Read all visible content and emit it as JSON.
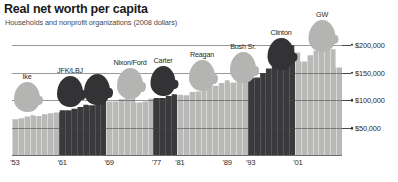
{
  "header": {
    "title": "Real net worth per capita",
    "subtitle": "Households and nonprofit organizations (2008 dollars)"
  },
  "caption": "",
  "chart_data": {
    "type": "bar",
    "title": "Real net worth per capita",
    "subtitle": "Households and nonprofit organizations (2008 dollars)",
    "xlabel": "",
    "ylabel": "",
    "ylim": [
      0,
      230000
    ],
    "grid": true,
    "legend_position": "none",
    "ytick_labels": [
      "$200,000",
      "$150,000",
      "$100,000",
      "$50,000"
    ],
    "ytick_values": [
      200000,
      150000,
      100000,
      50000
    ],
    "xtick_labels": [
      "'53",
      "'61",
      "'69",
      "'77",
      "'81",
      "'89",
      "'93",
      "'01"
    ],
    "xtick_years": [
      1953,
      1961,
      1969,
      1977,
      1981,
      1989,
      1993,
      2001
    ],
    "categories": [
      1953,
      1954,
      1955,
      1956,
      1957,
      1958,
      1959,
      1960,
      1961,
      1962,
      1963,
      1964,
      1965,
      1966,
      1967,
      1968,
      1969,
      1970,
      1971,
      1972,
      1973,
      1974,
      1975,
      1976,
      1977,
      1978,
      1979,
      1980,
      1981,
      1982,
      1983,
      1984,
      1985,
      1986,
      1987,
      1988,
      1989,
      1990,
      1991,
      1992,
      1993,
      1994,
      1995,
      1996,
      1997,
      1998,
      1999,
      2000,
      2001,
      2002,
      2003,
      2004,
      2005,
      2006,
      2007,
      2008
    ],
    "values": [
      67000,
      69000,
      72000,
      74000,
      73000,
      76000,
      78000,
      79000,
      83000,
      83000,
      86000,
      89000,
      93000,
      92000,
      97000,
      101000,
      99000,
      99000,
      103000,
      108000,
      105000,
      97000,
      99000,
      104000,
      105000,
      105000,
      109000,
      112000,
      111000,
      110000,
      116000,
      117000,
      122000,
      127000,
      127000,
      132000,
      137000,
      133000,
      137000,
      138000,
      141000,
      142000,
      150000,
      158000,
      170000,
      182000,
      196000,
      200000,
      187000,
      171000,
      182000,
      190000,
      196000,
      198000,
      193000,
      160000
    ],
    "series_colors": {
      "republican": "#b9b9b7",
      "democrat": "#3a3a3c"
    },
    "party_by_year": [
      "R",
      "R",
      "R",
      "R",
      "R",
      "R",
      "R",
      "R",
      "D",
      "D",
      "D",
      "D",
      "D",
      "D",
      "D",
      "D",
      "R",
      "R",
      "R",
      "R",
      "R",
      "R",
      "R",
      "R",
      "D",
      "D",
      "D",
      "D",
      "R",
      "R",
      "R",
      "R",
      "R",
      "R",
      "R",
      "R",
      "R",
      "R",
      "R",
      "R",
      "D",
      "D",
      "D",
      "D",
      "D",
      "D",
      "D",
      "D",
      "R",
      "R",
      "R",
      "R",
      "R",
      "R",
      "R",
      "R"
    ],
    "annotations": [
      {
        "label": "Ike",
        "party": "republican",
        "years": "1953-1960"
      },
      {
        "label": "JFK/LBJ",
        "party": "democrat",
        "years": "1961-1968"
      },
      {
        "label": "Nixon/Ford",
        "party": "republican",
        "years": "1969-1976"
      },
      {
        "label": "Carter",
        "party": "democrat",
        "years": "1977-1980"
      },
      {
        "label": "Reagan",
        "party": "republican",
        "years": "1981-1988"
      },
      {
        "label": "Bush Sr.",
        "party": "republican",
        "years": "1989-1992"
      },
      {
        "label": "Clinton",
        "party": "democrat",
        "years": "1993-2000"
      },
      {
        "label": "GW",
        "party": "republican",
        "years": "2001-2008"
      }
    ]
  },
  "presidents": [
    {
      "label": "Ike",
      "tone": "light",
      "cx": 27,
      "headTop": 82,
      "headW": 26,
      "headH": 30,
      "labTop": 72
    },
    {
      "label": "JFK/LBJ",
      "tone": "dark",
      "cx": 70,
      "headTop": 76,
      "headW": 26,
      "headH": 31,
      "labTop": 66
    },
    {
      "label": "JFK/LBJ-2",
      "tone": "dark",
      "cx": 97,
      "headTop": 74,
      "headW": 26,
      "headH": 31,
      "labTop": 64
    },
    {
      "label": "Nixon/Ford",
      "tone": "light",
      "cx": 130,
      "headTop": 68,
      "headW": 26,
      "headH": 31,
      "labTop": 58
    },
    {
      "label": "Carter",
      "tone": "dark",
      "cx": 163,
      "headTop": 66,
      "headW": 25,
      "headH": 30,
      "labTop": 56
    },
    {
      "label": "Reagan",
      "tone": "light",
      "cx": 202,
      "headTop": 60,
      "headW": 26,
      "headH": 31,
      "labTop": 50
    },
    {
      "label": "Bush Sr.",
      "tone": "light",
      "cx": 243,
      "headTop": 52,
      "headW": 26,
      "headH": 31,
      "labTop": 42
    },
    {
      "label": "Clinton",
      "tone": "dark",
      "cx": 281,
      "headTop": 38,
      "headW": 27,
      "headH": 32,
      "labTop": 28
    },
    {
      "label": "GW",
      "tone": "light",
      "cx": 322,
      "headTop": 20,
      "headW": 27,
      "headH": 32,
      "labTop": 10
    }
  ],
  "president_label_text": {
    "p0": "Ike",
    "p1": "JFK/LBJ",
    "p2": "",
    "p3": "Nixon/Ford",
    "p4": "Carter",
    "p5": "Reagan",
    "p6": "Bush Sr.",
    "p7": "Clinton",
    "p8": "GW"
  }
}
